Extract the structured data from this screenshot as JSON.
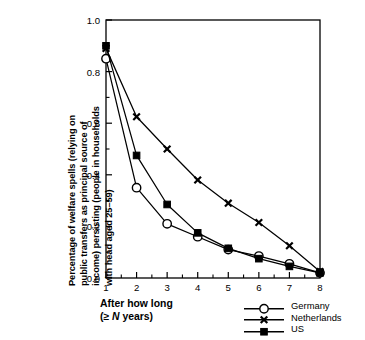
{
  "chart_data": {
    "type": "line",
    "title": "",
    "xlabel": "After how long (≥ N years)",
    "xlabel_lines": [
      "After how long",
      "(≥ N years)"
    ],
    "ylabel": "Percentage of welfare spells (relying on public transfers as principal source of income) persisting (people in households with head aged 25–59)",
    "ylabel_lines": [
      "Percentage of welfare spells (relying on",
      "public transfers as principal source of",
      "income) persisting (people in households",
      "with head aged 25–59)"
    ],
    "x": [
      1,
      2,
      3,
      4,
      5,
      6,
      7,
      8
    ],
    "xlim": [
      1,
      8
    ],
    "ylim": [
      0.0,
      1.0
    ],
    "xtick_labels": [
      "1",
      "2",
      "3",
      "4",
      "5",
      "6",
      "7",
      "8"
    ],
    "ytick_labels": [
      "0.0",
      "0.2",
      "0.4",
      "0.6",
      "0.8",
      "1.0"
    ],
    "ytick_values": [
      0.0,
      0.2,
      0.4,
      0.6,
      0.8,
      1.0
    ],
    "yminor_values": [
      0.1,
      0.3,
      0.5,
      0.7,
      0.9
    ],
    "grid": false,
    "legend_position": "bottom-right",
    "series": [
      {
        "name": "Germany",
        "marker": "open-circle",
        "color": "#000000",
        "values": [
          0.85,
          0.35,
          0.21,
          0.16,
          0.11,
          0.085,
          0.055,
          0.02
        ]
      },
      {
        "name": "Netherlands",
        "marker": "x-cross",
        "color": "#000000",
        "values": [
          0.89,
          0.625,
          0.5,
          0.38,
          0.29,
          0.215,
          0.125,
          0.025
        ]
      },
      {
        "name": "US",
        "marker": "filled-square",
        "color": "#000000",
        "values": [
          0.9,
          0.475,
          0.285,
          0.175,
          0.115,
          0.075,
          0.045,
          0.02
        ]
      }
    ]
  },
  "legend": {
    "items": [
      {
        "label": "Germany"
      },
      {
        "label": "Netherlands"
      },
      {
        "label": "US"
      }
    ]
  }
}
